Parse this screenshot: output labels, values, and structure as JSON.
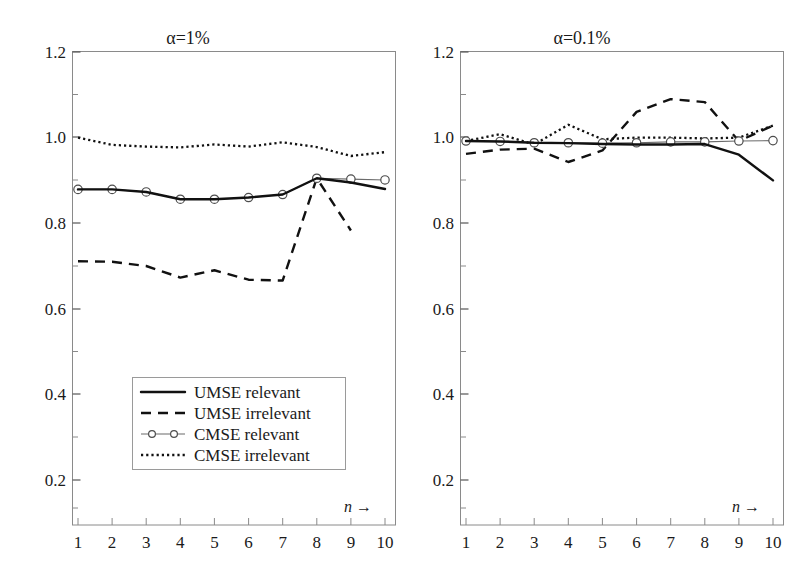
{
  "figure": {
    "background": "#ffffff",
    "ink_color": "#111111"
  },
  "panels": [
    {
      "id": "left",
      "title": "α=1%"
    },
    {
      "id": "right",
      "title": "α=0.1%"
    }
  ],
  "axis": {
    "x_label": "n",
    "x_arrow": "→",
    "x_ticks": [
      "1",
      "2",
      "3",
      "4",
      "5",
      "6",
      "7",
      "8",
      "9",
      "10"
    ],
    "y_ticks": [
      "0.2",
      "0.4",
      "0.6",
      "0.8",
      "1.0",
      "1.2"
    ]
  },
  "legend": {
    "position": "inside-lower-center-left-panel",
    "items": [
      {
        "label": "UMSE relevant",
        "style": "solid",
        "color": "#111111"
      },
      {
        "label": "UMSE irrelevant",
        "style": "dashed",
        "color": "#111111"
      },
      {
        "label": "CMSE relevant",
        "style": "line-markers",
        "color": "#6b6b6b"
      },
      {
        "label": "CMSE irrelevant",
        "style": "dotted",
        "color": "#111111"
      }
    ]
  },
  "chart_data": {
    "type": "line",
    "xlabel": "n",
    "ylabel": "",
    "xlim": [
      0.6,
      10.4
    ],
    "ylim": [
      0.13,
      1.2
    ],
    "grid": false,
    "legend_position": "lower-center of left panel",
    "x": [
      1,
      2,
      3,
      4,
      5,
      6,
      7,
      8,
      9,
      10
    ],
    "panels": [
      {
        "name": "alpha=1%",
        "title": "α=1%",
        "series": [
          {
            "name": "UMSE relevant",
            "style": "solid",
            "x": [
              1,
              2,
              3,
              4,
              5,
              6,
              7,
              8,
              9,
              10
            ],
            "values": [
              0.879,
              0.879,
              0.873,
              0.856,
              0.856,
              0.86,
              0.867,
              0.905,
              0.895,
              0.88
            ]
          },
          {
            "name": "UMSE irrelevant",
            "style": "dashed",
            "x": [
              1,
              2,
              3,
              4,
              5,
              6,
              7,
              8,
              9
            ],
            "values": [
              0.711,
              0.71,
              0.7,
              0.673,
              0.69,
              0.668,
              0.666,
              0.905,
              0.783
            ]
          },
          {
            "name": "CMSE relevant",
            "style": "line-markers",
            "x": [
              1,
              2,
              3,
              4,
              5,
              6,
              7,
              8,
              9,
              10
            ],
            "values": [
              0.879,
              0.879,
              0.873,
              0.856,
              0.856,
              0.86,
              0.867,
              0.905,
              0.903,
              0.901
            ]
          },
          {
            "name": "CMSE irrelevant",
            "style": "dotted",
            "x": [
              1,
              2,
              3,
              4,
              5,
              6,
              7,
              8,
              9,
              10
            ],
            "values": [
              1.0,
              0.983,
              0.979,
              0.977,
              0.984,
              0.979,
              0.989,
              0.978,
              0.957,
              0.966
            ]
          }
        ]
      },
      {
        "name": "alpha=0.1%",
        "title": "α=0.1%",
        "series": [
          {
            "name": "UMSE relevant",
            "style": "solid",
            "x": [
              1,
              2,
              3,
              4,
              5,
              6,
              7,
              8,
              9,
              10
            ],
            "values": [
              0.992,
              0.991,
              0.988,
              0.987,
              0.985,
              0.984,
              0.984,
              0.985,
              0.96,
              0.9
            ]
          },
          {
            "name": "UMSE irrelevant",
            "style": "dashed",
            "x": [
              1,
              2,
              3,
              4,
              5,
              6,
              7,
              8,
              9,
              10
            ],
            "values": [
              0.962,
              0.972,
              0.974,
              0.943,
              0.97,
              1.06,
              1.09,
              1.083,
              0.992,
              1.028
            ]
          },
          {
            "name": "CMSE relevant",
            "style": "line-markers",
            "x": [
              1,
              2,
              3,
              4,
              5,
              6,
              7,
              8,
              9,
              10
            ],
            "values": [
              0.992,
              0.991,
              0.988,
              0.988,
              0.987,
              0.988,
              0.99,
              0.99,
              0.992,
              0.993
            ]
          },
          {
            "name": "CMSE irrelevant",
            "style": "dotted",
            "x": [
              1,
              2,
              3,
              4,
              5,
              6,
              7,
              8,
              9,
              10
            ],
            "values": [
              0.992,
              1.008,
              0.984,
              1.03,
              0.996,
              1.0,
              1.0,
              0.998,
              1.0,
              1.028
            ]
          }
        ]
      }
    ]
  }
}
